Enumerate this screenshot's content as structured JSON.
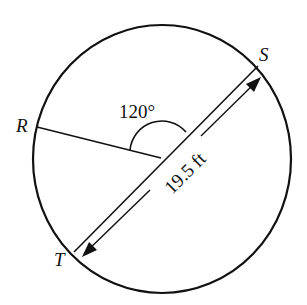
{
  "diagram": {
    "type": "circle-geometry",
    "points": {
      "R": {
        "label": "R"
      },
      "S": {
        "label": "S"
      },
      "T": {
        "label": "T"
      }
    },
    "angle": {
      "label": "120°",
      "value_degrees": 120,
      "between": [
        "R",
        "S"
      ]
    },
    "diameter": {
      "label": "19.5 ft",
      "value": 19.5,
      "unit": "ft",
      "endpoints": [
        "S",
        "T"
      ]
    },
    "colors": {
      "stroke": "#111111",
      "background": "#ffffff"
    }
  }
}
